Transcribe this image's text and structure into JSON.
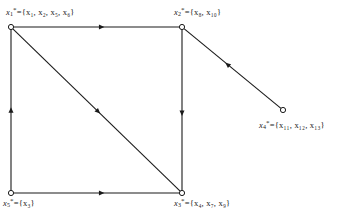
{
  "figure": {
    "type": "directed-graph",
    "background_color": "#ffffff",
    "line_color": "#1a1a1a",
    "node_fill": "#ffffff",
    "node_stroke": "#1a1a1a"
  },
  "nodes": [
    {
      "id": "x1",
      "name": "node-x1",
      "x": 11,
      "y": 27,
      "label_var": "x",
      "label_sub": "1",
      "label_sup": "*",
      "label_eq": "=",
      "label_set": "{x₁, x₂, x₅, x₆}",
      "members": [
        "x₁",
        "x₂",
        "x₅",
        "x₆"
      ],
      "label_full": "x₁* = {x₁, x₂, x₅, x₆}"
    },
    {
      "id": "x2",
      "name": "node-x2",
      "x": 182,
      "y": 27,
      "label_var": "x",
      "label_sub": "2",
      "label_sup": "*",
      "label_eq": "=",
      "label_set": "{x₈, x₁₀}",
      "members": [
        "x₈",
        "x₁₀"
      ],
      "label_full": "x₂* = {x₈, x₁₀}"
    },
    {
      "id": "x3",
      "name": "node-x3",
      "x": 182,
      "y": 193,
      "label_var": "x",
      "label_sub": "3",
      "label_sup": "*",
      "label_eq": "=",
      "label_set": "{x₄, x₇, x₉}",
      "members": [
        "x₄",
        "x₇",
        "x₉"
      ],
      "label_full": "x₃* = {x₄, x₇, x₉}"
    },
    {
      "id": "x4",
      "name": "node-x4",
      "x": 283,
      "y": 110,
      "label_var": "x",
      "label_sub": "4",
      "label_sup": "*",
      "label_eq": "=",
      "label_set": "{x₁₁, x₁₂, x₁₃}",
      "members": [
        "x₁₁",
        "x₁₂",
        "x₁₃"
      ],
      "label_full": "x₄* = {x₁₁, x₁₂, x₁₃}"
    },
    {
      "id": "x5",
      "name": "node-x5",
      "x": 11,
      "y": 193,
      "label_var": "x",
      "label_sub": "5",
      "label_sup": "*",
      "label_eq": "=",
      "label_set": "{x₃}",
      "members": [
        "x₃"
      ],
      "label_full": "x₅* = {x₃}"
    }
  ],
  "edges": [
    {
      "id": "e-x1-x2",
      "name": "edge-x1-to-x2",
      "from": "x1",
      "to": "x2",
      "x1": 11,
      "y1": 27,
      "x2": 182,
      "y2": 27,
      "arrow_at": 0.53,
      "direction": "right"
    },
    {
      "id": "e-x1-x3",
      "name": "edge-x1-to-x3",
      "from": "x1",
      "to": "x3",
      "x1": 11,
      "y1": 27,
      "x2": 182,
      "y2": 193,
      "arrow_at": 0.51,
      "direction": "down-right"
    },
    {
      "id": "e-x2-x3",
      "name": "edge-x2-to-x3",
      "from": "x2",
      "to": "x3",
      "x1": 182,
      "y1": 27,
      "x2": 182,
      "y2": 193,
      "arrow_at": 0.52,
      "direction": "down"
    },
    {
      "id": "e-x5-x1",
      "name": "edge-x5-to-x1",
      "from": "x5",
      "to": "x1",
      "x1": 11,
      "y1": 193,
      "x2": 11,
      "y2": 27,
      "arrow_at": 0.5,
      "direction": "up"
    },
    {
      "id": "e-x5-x3",
      "name": "edge-x5-to-x3",
      "from": "x5",
      "to": "x3",
      "x1": 11,
      "y1": 193,
      "x2": 182,
      "y2": 193,
      "arrow_at": 0.53,
      "direction": "right"
    },
    {
      "id": "e-x4-x2",
      "name": "edge-x4-to-x2",
      "from": "x4",
      "to": "x2",
      "x1": 283,
      "y1": 110,
      "x2": 182,
      "y2": 27,
      "arrow_at": 0.55,
      "direction": "up-left"
    }
  ]
}
